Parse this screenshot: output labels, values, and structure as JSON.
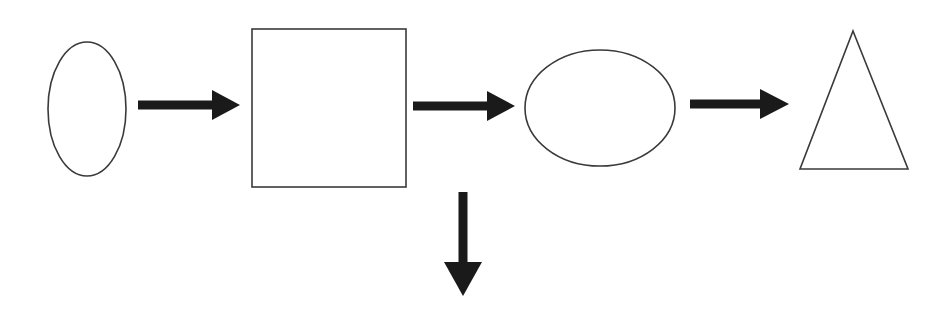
{
  "canvas": {
    "width": 950,
    "height": 322,
    "background_color": "#ffffff",
    "title": "Shape flow diagram"
  },
  "style": {
    "outline_color": "#3a3a3a",
    "outline_width": 1.6,
    "arrow_color": "#1a1a1a",
    "shape_fill": "#ffffff"
  },
  "diagram": {
    "type": "flowchart",
    "orientation": "left-to-right",
    "node_count": 4,
    "edge_count": 4,
    "nodes": [
      {
        "id": "node-1",
        "shape": "ellipse",
        "label": "",
        "cx": 87,
        "cy": 109,
        "rx": 39,
        "ry": 67
      },
      {
        "id": "node-2",
        "shape": "rectangle",
        "label": "",
        "x": 252,
        "y": 29,
        "width": 154,
        "height": 158
      },
      {
        "id": "node-3",
        "shape": "ellipse",
        "label": "",
        "cx": 600,
        "cy": 108,
        "rx": 75,
        "ry": 58
      },
      {
        "id": "node-4",
        "shape": "triangle",
        "label": "",
        "apex_x": 853,
        "apex_y": 31,
        "base_left_x": 800,
        "base_right_x": 908,
        "base_y": 169
      }
    ],
    "edges": [
      {
        "id": "edge-1",
        "from": "node-1",
        "to": "node-2",
        "direction": "right",
        "label": "",
        "shaft_start_x": 138,
        "shaft_end_x": 214,
        "shaft_y": 105,
        "shaft_thickness": 9,
        "head_tip_x": 240,
        "head_half_height": 15
      },
      {
        "id": "edge-2",
        "from": "node-2",
        "to": "node-3",
        "direction": "right",
        "label": "",
        "shaft_start_x": 413,
        "shaft_end_x": 489,
        "shaft_y": 106,
        "shaft_thickness": 9,
        "head_tip_x": 515,
        "head_half_height": 15
      },
      {
        "id": "edge-3",
        "from": "node-3",
        "to": "node-4",
        "direction": "right",
        "label": "",
        "shaft_start_x": 690,
        "shaft_end_x": 762,
        "shaft_y": 104,
        "shaft_thickness": 9,
        "head_tip_x": 789,
        "head_half_height": 15
      },
      {
        "id": "edge-4",
        "from": "node-2",
        "to": null,
        "direction": "down",
        "label": "",
        "shaft_x": 463,
        "shaft_start_y": 192,
        "shaft_end_y": 263,
        "shaft_thickness": 9,
        "head_tip_y": 296,
        "head_half_width": 19
      }
    ]
  }
}
